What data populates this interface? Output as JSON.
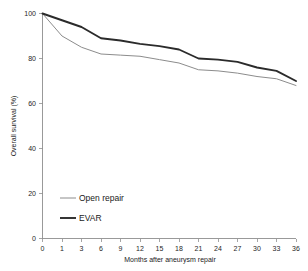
{
  "chart_data": {
    "type": "line",
    "title": "",
    "subtitle": "",
    "xlabel": "Months after aneurysm repair",
    "ylabel": "Overall survival (%)",
    "xlim": [
      0,
      36
    ],
    "ylim": [
      0,
      100
    ],
    "grid": false,
    "legend_position": "inside-lower-left",
    "x_tick_labels": [
      "0",
      "1",
      "3",
      "6",
      "9",
      "12",
      "15",
      "18",
      "21",
      "24",
      "27",
      "30",
      "33",
      "36"
    ],
    "x_ticks": [
      0,
      1,
      3,
      6,
      9,
      12,
      15,
      18,
      21,
      24,
      27,
      30,
      33,
      36
    ],
    "y_tick_labels": [
      "0",
      "20",
      "40",
      "60",
      "80",
      "100"
    ],
    "y_ticks": [
      0,
      20,
      40,
      60,
      80,
      100
    ],
    "x": [
      0,
      1,
      3,
      6,
      9,
      12,
      15,
      18,
      21,
      24,
      27,
      30,
      33,
      36
    ],
    "series": [
      {
        "name": "Open repair",
        "color": "#8c8c8c",
        "values": [
          100,
          90,
          85,
          82,
          81.5,
          81,
          79.5,
          78,
          75,
          74.5,
          73.5,
          72,
          71,
          68
        ]
      },
      {
        "name": "EVAR",
        "color": "#2b2b2b",
        "values": [
          100,
          97,
          94,
          89,
          88,
          86.5,
          85.5,
          84,
          80,
          79.5,
          78.5,
          76,
          74.5,
          70
        ]
      }
    ]
  },
  "legend": {
    "items": [
      {
        "label": "Open repair"
      },
      {
        "label": "EVAR"
      }
    ]
  },
  "axes": {
    "x_title": "Months after aneurysm repair",
    "y_title": "Overall survival (%)"
  }
}
